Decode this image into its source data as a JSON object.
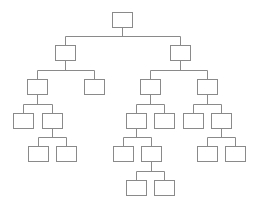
{
  "diagram": {
    "type": "tree",
    "title": "",
    "colors": {
      "stroke": "#8a8a8a",
      "fill": "#ffffff",
      "background": "#ffffff"
    },
    "box": {
      "width": 20,
      "height": 15
    },
    "nodes": [
      {
        "id": "root",
        "x": 112,
        "y": 12,
        "label": ""
      },
      {
        "id": "L",
        "x": 55,
        "y": 45,
        "label": ""
      },
      {
        "id": "R",
        "x": 170,
        "y": 45,
        "label": ""
      },
      {
        "id": "LL",
        "x": 27,
        "y": 79,
        "label": ""
      },
      {
        "id": "LR",
        "x": 84,
        "y": 79,
        "label": ""
      },
      {
        "id": "RL",
        "x": 140,
        "y": 79,
        "label": ""
      },
      {
        "id": "RR",
        "x": 197,
        "y": 79,
        "label": ""
      },
      {
        "id": "LLL",
        "x": 13,
        "y": 113,
        "label": ""
      },
      {
        "id": "LLR",
        "x": 42,
        "y": 113,
        "label": ""
      },
      {
        "id": "RLL",
        "x": 126,
        "y": 113,
        "label": ""
      },
      {
        "id": "RLR",
        "x": 154,
        "y": 113,
        "label": ""
      },
      {
        "id": "RRL",
        "x": 183,
        "y": 113,
        "label": ""
      },
      {
        "id": "RRR",
        "x": 211,
        "y": 113,
        "label": ""
      },
      {
        "id": "LLRL",
        "x": 28,
        "y": 146,
        "label": ""
      },
      {
        "id": "LLRR",
        "x": 56,
        "y": 146,
        "label": ""
      },
      {
        "id": "RLLL",
        "x": 113,
        "y": 146,
        "label": ""
      },
      {
        "id": "RLLR",
        "x": 141,
        "y": 146,
        "label": ""
      },
      {
        "id": "RRRL",
        "x": 197,
        "y": 146,
        "label": ""
      },
      {
        "id": "RRRR",
        "x": 225,
        "y": 146,
        "label": ""
      },
      {
        "id": "RLLRL",
        "x": 126,
        "y": 180,
        "label": ""
      },
      {
        "id": "RLLRR",
        "x": 154,
        "y": 180,
        "label": ""
      }
    ],
    "edges": [
      {
        "parent": "root",
        "children": [
          "L",
          "R"
        ]
      },
      {
        "parent": "L",
        "children": [
          "LL",
          "LR"
        ]
      },
      {
        "parent": "R",
        "children": [
          "RL",
          "RR"
        ]
      },
      {
        "parent": "LL",
        "children": [
          "LLL",
          "LLR"
        ]
      },
      {
        "parent": "RL",
        "children": [
          "RLL",
          "RLR"
        ]
      },
      {
        "parent": "RR",
        "children": [
          "RRL",
          "RRR"
        ]
      },
      {
        "parent": "LLR",
        "children": [
          "LLRL",
          "LLRR"
        ]
      },
      {
        "parent": "RLL",
        "children": [
          "RLLL",
          "RLLR"
        ]
      },
      {
        "parent": "RRR",
        "children": [
          "RRRL",
          "RRRR"
        ]
      },
      {
        "parent": "RLLR",
        "children": [
          "RLLRL",
          "RLLRR"
        ]
      }
    ]
  }
}
